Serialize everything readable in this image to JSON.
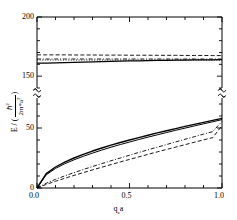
{
  "figure": {
    "width": 237,
    "height": 220,
    "background": "#ffffff",
    "line_color": "#000000"
  },
  "axes": {
    "frame": {
      "left": 37,
      "right": 222,
      "top": 17,
      "bottom": 188
    },
    "y_break": {
      "present": true,
      "marker": "squiggle",
      "pixel_y": 93,
      "note": "axis broken between lower and upper energy bands"
    },
    "x_axis": {
      "label_parts": {
        "symbol": "q",
        "subscript": "z",
        "suffix": "a"
      },
      "label_text": "q z a",
      "ticks": [
        0.0,
        0.5,
        1.0
      ],
      "tick_labels": [
        "0.0",
        "0.5",
        "1.0"
      ],
      "minor_ticks_per_interval": 4,
      "range": [
        0.0,
        1.0
      ]
    },
    "y_axis": {
      "label_text": "E / ( h-bar^2 / 2 m* a^2 )",
      "label_parts": {
        "lead": "E / (",
        "numerator": "ℏ",
        "numerator_sup": "2",
        "denominator": "2m*a",
        "denominator_sup": "2",
        "trail": ")"
      },
      "tick_labels": [
        "0",
        "50",
        "150",
        "200"
      ],
      "tick_values": [
        0,
        50,
        150,
        200
      ],
      "lower_segment_range": [
        0,
        75
      ],
      "upper_segment_range": [
        140,
        200
      ]
    }
  },
  "chart_data": {
    "type": "line",
    "title": "",
    "xlabel": "q_z a",
    "ylabel": "E / (hbar^2 / 2 m* a^2)",
    "xlim": [
      0.0,
      1.0
    ],
    "ylim_lower_band": [
      0,
      75
    ],
    "ylim_upper_band": [
      140,
      200
    ],
    "grid": false,
    "legend": "none",
    "axis_break": true,
    "x": [
      0.0,
      0.05,
      0.1,
      0.15,
      0.2,
      0.25,
      0.3,
      0.35,
      0.4,
      0.45,
      0.5,
      0.55,
      0.6,
      0.65,
      0.7,
      0.75,
      0.8,
      0.85,
      0.9,
      0.95,
      1.0
    ],
    "series": [
      {
        "name": "upper-band-dashed-1",
        "band": "upper",
        "style": "dashed",
        "width": 0.9,
        "color": "#000000",
        "values": [
          168.0,
          168.0,
          168.0,
          168.0,
          167.9,
          167.9,
          167.9,
          167.8,
          167.8,
          167.8,
          167.7,
          167.7,
          167.7,
          167.6,
          167.6,
          167.6,
          167.5,
          167.5,
          167.5,
          167.4,
          167.4
        ]
      },
      {
        "name": "upper-band-dashdot-2",
        "band": "upper",
        "style": "dashdot",
        "width": 0.9,
        "color": "#000000",
        "values": [
          164.5,
          164.5,
          164.5,
          164.5,
          164.5,
          164.5,
          164.5,
          164.5,
          164.5,
          164.5,
          164.5,
          164.5,
          164.5,
          164.5,
          164.5,
          164.5,
          164.5,
          164.5,
          164.5,
          164.5,
          164.5
        ]
      },
      {
        "name": "upper-band-dotted-3",
        "band": "upper",
        "style": "dotted",
        "width": 0.9,
        "color": "#000000",
        "values": [
          163.6,
          163.6,
          163.6,
          163.6,
          163.6,
          163.6,
          163.6,
          163.6,
          163.6,
          163.6,
          163.6,
          163.6,
          163.6,
          163.6,
          163.6,
          163.6,
          163.6,
          163.6,
          163.6,
          163.6,
          163.6
        ]
      },
      {
        "name": "upper-band-solid-4",
        "band": "upper",
        "style": "solid",
        "width": 1.3,
        "color": "#000000",
        "values": [
          161.0,
          161.1,
          161.3,
          161.5,
          161.7,
          161.9,
          162.1,
          162.3,
          162.5,
          162.7,
          162.9,
          163.0,
          163.2,
          163.3,
          163.4,
          163.5,
          163.6,
          163.7,
          163.8,
          163.85,
          163.9
        ]
      },
      {
        "name": "lower-band-solid-1",
        "band": "lower",
        "style": "solid",
        "width": 1.4,
        "color": "#000000",
        "values": [
          0.0,
          12.0,
          17.5,
          21.5,
          25.0,
          28.0,
          30.8,
          33.3,
          35.7,
          37.9,
          40.0,
          42.0,
          44.0,
          45.9,
          47.7,
          49.5,
          51.3,
          53.0,
          54.7,
          56.4,
          58.0
        ]
      },
      {
        "name": "lower-band-solid-2",
        "band": "lower",
        "style": "solid",
        "width": 1.0,
        "color": "#000000",
        "values": [
          0.0,
          11.0,
          16.3,
          20.2,
          23.5,
          26.4,
          29.1,
          31.6,
          34.0,
          36.2,
          38.3,
          40.4,
          42.4,
          44.3,
          46.2,
          48.1,
          49.9,
          51.7,
          53.5,
          55.2,
          57.0
        ]
      },
      {
        "name": "lower-band-dashdot-3",
        "band": "lower",
        "style": "dashdot",
        "width": 0.9,
        "color": "#000000",
        "values": [
          0.0,
          4.0,
          7.2,
          10.1,
          12.8,
          15.4,
          17.9,
          20.3,
          22.7,
          25.0,
          27.3,
          29.6,
          31.8,
          34.0,
          36.2,
          38.4,
          40.6,
          42.7,
          44.9,
          47.0,
          55.5
        ]
      },
      {
        "name": "lower-band-dashed-4",
        "band": "lower",
        "style": "dashed",
        "width": 0.9,
        "color": "#000000",
        "values": [
          0.0,
          3.0,
          5.6,
          8.1,
          10.5,
          12.8,
          15.1,
          17.3,
          19.5,
          21.7,
          23.8,
          25.9,
          28.0,
          30.1,
          32.1,
          34.1,
          36.1,
          38.1,
          40.1,
          42.0,
          52.0
        ]
      }
    ]
  }
}
